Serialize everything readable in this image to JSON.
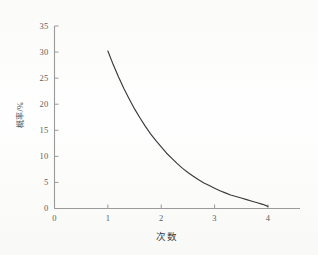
{
  "chart_data": {
    "type": "line",
    "title": "",
    "subtitle": "",
    "xlabel": "次数",
    "ylabel": "概率/%",
    "xlim": [
      0,
      4.6
    ],
    "ylim": [
      0,
      35
    ],
    "xticks": [
      "0",
      "1",
      "2",
      "3",
      "4"
    ],
    "xtick_values": [
      0,
      1,
      2,
      3,
      4
    ],
    "yticks": [
      "0",
      "5",
      "10",
      "15",
      "20",
      "25",
      "30",
      "35"
    ],
    "ytick_values": [
      0,
      5,
      10,
      15,
      20,
      25,
      30,
      35
    ],
    "grid": false,
    "legend": null,
    "legend_position": "none",
    "annotations": [],
    "series": [
      {
        "name": "概率",
        "color": "#3a3a3a",
        "x": [
          1.0,
          1.1,
          1.2,
          1.3,
          1.4,
          1.5,
          1.6,
          1.7,
          1.8,
          1.9,
          2.0,
          2.1,
          2.2,
          2.3,
          2.4,
          2.5,
          2.6,
          2.7,
          2.8,
          2.9,
          3.0,
          3.1,
          3.2,
          3.3,
          3.4,
          3.5,
          3.6,
          3.7,
          3.8,
          3.9,
          4.0
        ],
        "values": [
          30.2,
          27.6,
          25.2,
          23.0,
          21.0,
          19.1,
          17.4,
          15.8,
          14.3,
          13.0,
          11.8,
          10.6,
          9.6,
          8.6,
          7.7,
          6.9,
          6.2,
          5.5,
          4.9,
          4.4,
          3.9,
          3.4,
          3.0,
          2.6,
          2.3,
          2.0,
          1.7,
          1.4,
          1.1,
          0.8,
          0.4
        ]
      }
    ]
  },
  "axes": {
    "y_axis_label": "概率/%",
    "x_axis_label": "次数"
  }
}
